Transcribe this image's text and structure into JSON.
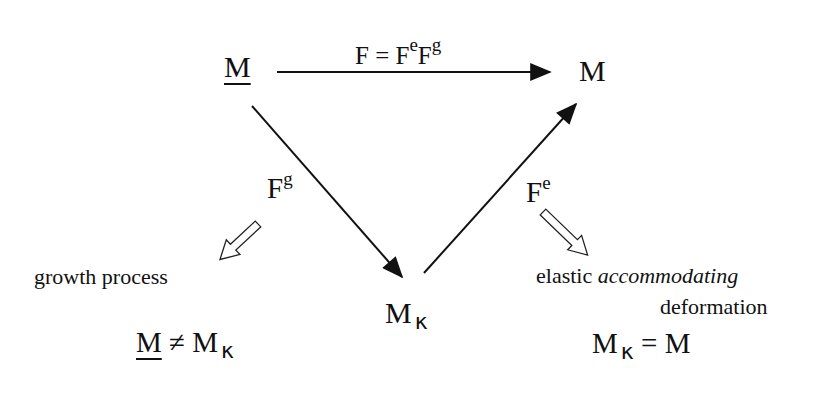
{
  "nodes": {
    "reference": {
      "symbol": "M",
      "underlined": true
    },
    "current": {
      "symbol": "M"
    },
    "intermediate": {
      "symbol": "M",
      "subscript": "κ"
    }
  },
  "arrows": {
    "total": {
      "lhs": "F",
      "eq": " = ",
      "f1": "F",
      "s1": "e",
      "f2": "F",
      "s2": "g"
    },
    "growth": {
      "base": "F",
      "sup": "g"
    },
    "elastic": {
      "base": "F",
      "sup": "e"
    }
  },
  "annotations": {
    "growth_label": "growth process",
    "elastic_label_plain": "elastic ",
    "elastic_label_italic": "accommodating",
    "elastic_label_line2": "deformation"
  },
  "relations": {
    "left": {
      "a": "M",
      "op": " ≠ ",
      "b": "M",
      "b_sub": "κ"
    },
    "right": {
      "a": "M",
      "a_sub": "κ",
      "op": " = ",
      "b": "M"
    }
  }
}
